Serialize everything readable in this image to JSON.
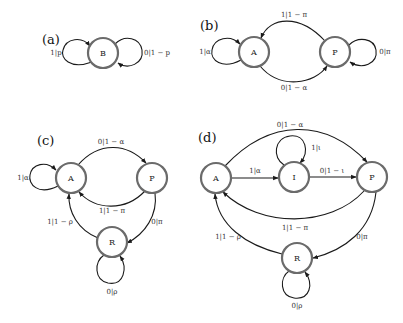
{
  "panels": {
    "a": {
      "label": "(a)",
      "nodes": {
        "B": "B"
      },
      "edges": {
        "B_self_left": "1|p",
        "B_self_right": "0|1 − p"
      }
    },
    "b": {
      "label": "(b)",
      "nodes": {
        "A": "A",
        "P": "P"
      },
      "edges": {
        "A_self": "1|α",
        "P_to_A": "1|1 − π",
        "A_to_P": "0|1 − α",
        "P_self": "0|π"
      }
    },
    "c": {
      "label": "(c)",
      "nodes": {
        "A": "A",
        "P": "P",
        "R": "R"
      },
      "edges": {
        "A_self": "1|α",
        "A_to_P": "0|1 − α",
        "P_to_A": "1|1 − π",
        "P_to_R": "0|π",
        "R_to_A": "1|1 − ρ",
        "R_self": "0|ρ"
      }
    },
    "d": {
      "label": "(d)",
      "nodes": {
        "A": "A",
        "I": "I",
        "P": "P",
        "R": "R"
      },
      "edges": {
        "A_to_P": "0|1 − α",
        "I_self": "1|ι",
        "A_to_I": "1|α",
        "I_to_P": "0|1 − ι",
        "P_to_A": "1|1 − π",
        "P_to_R": "0|π",
        "R_to_A": "1|1 − ρ",
        "R_self": "0|ρ"
      }
    }
  },
  "colors": {
    "node_stroke": "#6b6b6b",
    "edge_stroke": "#1a1a1a",
    "background": "#ffffff"
  }
}
